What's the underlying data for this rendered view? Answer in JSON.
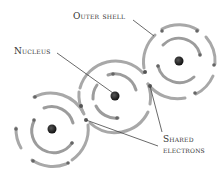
{
  "diagram": {
    "type": "covalent bonding atoms",
    "labels": {
      "outer_shell": "Outer shell",
      "nucleus": "Nucleus",
      "shared_line1": "Shared",
      "shared_line2": "electrons"
    },
    "atoms": [
      {
        "name": "left-atom",
        "cx": 52,
        "cy": 129
      },
      {
        "name": "middle-atom",
        "cx": 115,
        "cy": 96
      },
      {
        "name": "right-atom",
        "cx": 179,
        "cy": 61
      }
    ],
    "colors": {
      "shell": "#a6a6a6",
      "nucleus": "#1a1a1a",
      "electron": "#6a6a6a",
      "leader_line": "#444444"
    }
  }
}
